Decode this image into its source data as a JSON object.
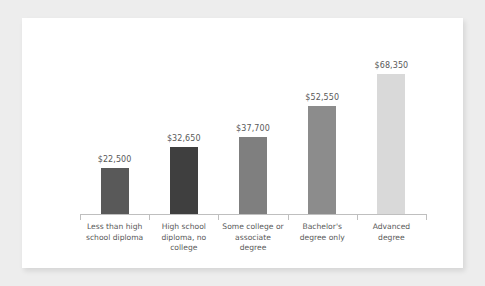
{
  "chart_data": {
    "type": "bar",
    "title": "",
    "subtitle": "",
    "xlabel": "",
    "ylabel": "",
    "grid": false,
    "legend": "none",
    "ylim": [
      0,
      68350
    ],
    "categories": [
      "Less than high school diploma",
      "High school diploma, no college",
      "Some college or associate degree",
      "Bachelor's degree only",
      "Advanced degree"
    ],
    "values": [
      22500,
      32650,
      37700,
      52550,
      68350
    ],
    "value_labels": [
      "$22,500",
      "$32,650",
      "$37,700",
      "$52,550",
      "$68,350"
    ],
    "bar_colors": [
      "#595959",
      "#3f3f3f",
      "#7f7f7f",
      "#8c8c8c",
      "#d9d9d9"
    ],
    "axis_color": "#bfbfbf",
    "label_color": "#595959",
    "card_background": "#ffffff",
    "page_background": "#ededed",
    "category_lines": [
      [
        "Less than high",
        "school diploma"
      ],
      [
        "High school",
        "diploma, no",
        "college"
      ],
      [
        "Some college or",
        "associate",
        "degree"
      ],
      [
        "Bachelor's",
        "degree only"
      ],
      [
        "Advanced",
        "degree"
      ]
    ]
  }
}
